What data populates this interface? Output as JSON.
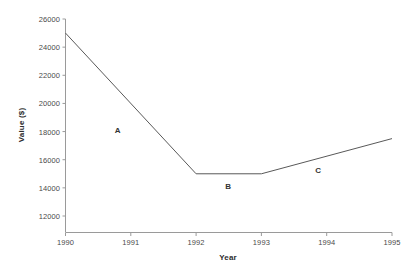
{
  "chart_data": {
    "type": "line",
    "title": "",
    "xlabel": "Year",
    "ylabel": "Value ($)",
    "x": [
      1990,
      1992,
      1993,
      1995
    ],
    "values": [
      25000,
      15000,
      15000,
      17500
    ],
    "series": [
      {
        "name": "Value",
        "points": [
          {
            "x": 1990,
            "y": 25000
          },
          {
            "x": 1992,
            "y": 15000
          },
          {
            "x": 1993,
            "y": 15000
          },
          {
            "x": 1995,
            "y": 17500
          }
        ]
      }
    ],
    "xlim": [
      1990,
      1995
    ],
    "ylim": [
      12000,
      26000
    ],
    "xticks": [
      1990,
      1991,
      1992,
      1993,
      1994,
      1995
    ],
    "xtick_labels": [
      "1990",
      "1991",
      "1992",
      "1993",
      "1994",
      "1995"
    ],
    "yticks": [
      12000,
      14000,
      16000,
      18000,
      20000,
      22000,
      24000,
      26000
    ],
    "ytick_labels": [
      "12000",
      "14000",
      "16000",
      "18000",
      "20000",
      "22000",
      "24000",
      "26000"
    ],
    "grid": false,
    "legend": "none",
    "line_color": "#595959",
    "axis_color": "#8c8c8c",
    "annotations": [
      {
        "label": "A",
        "x": 1990.8,
        "y": 18100,
        "segment": "1990-1992 decline"
      },
      {
        "label": "B",
        "x": 1992.49,
        "y": 14100,
        "segment": "1992-1993 flat"
      },
      {
        "label": "C",
        "x": 1993.87,
        "y": 15300,
        "segment": "1993-1995 rise"
      }
    ]
  }
}
